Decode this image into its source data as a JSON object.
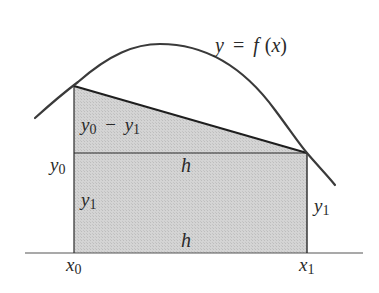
{
  "curve_label": {
    "y": "y",
    "eq": "=",
    "f": "f",
    "open": "(",
    "x": "x",
    "close": ")"
  },
  "labels": {
    "diff": {
      "y0_base": "y",
      "y0_sub": "0",
      "minus": "−",
      "y1_base": "y",
      "y1_sub": "1"
    },
    "left_y0": {
      "base": "y",
      "sub": "0"
    },
    "inner_y1": {
      "base": "y",
      "sub": "1"
    },
    "right_y1": {
      "base": "y",
      "sub": "1"
    },
    "h_top": "h",
    "h_bottom": "h",
    "x0": {
      "base": "x",
      "sub": "0"
    },
    "x1": {
      "base": "x",
      "sub": "1"
    }
  },
  "colors": {
    "stroke": "#2a2a2a",
    "fill": "#d2d2d2",
    "axis": "#555555"
  },
  "geometry": {
    "baseline_y": 253,
    "x0": 74,
    "x1": 307,
    "y0_px": 86,
    "y1_px": 153,
    "curve_peak": [
      160,
      44
    ]
  }
}
